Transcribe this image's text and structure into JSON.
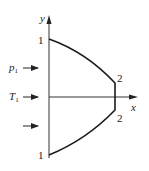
{
  "diagram": {
    "axes": {
      "x_label": "x",
      "y_label": "y",
      "color": "#333333"
    },
    "curve": {
      "color": "#1a1a1a",
      "points": {
        "top_start": "1",
        "top_end": "2",
        "bottom_end": "2",
        "bottom_start": "1"
      }
    },
    "inlet_arrows": [
      {
        "label": "p",
        "subscript": "1"
      },
      {
        "label": "T",
        "subscript": "1"
      },
      {
        "label": "",
        "subscript": ""
      }
    ]
  }
}
